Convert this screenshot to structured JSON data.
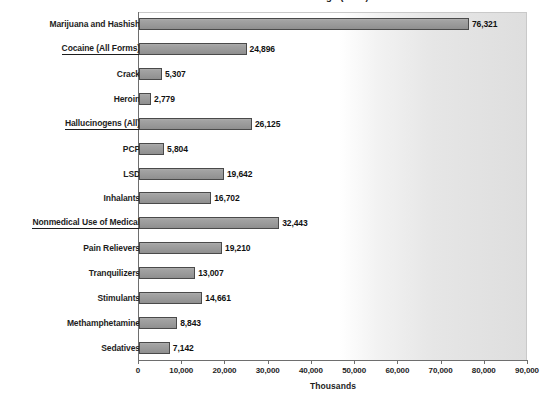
{
  "chart_data": {
    "type": "bar",
    "orientation": "horizontal",
    "title": "Past Year Use of Selected Drugs (2002)",
    "xlabel": "Thousands",
    "ylabel": "",
    "xlim": [
      0,
      90000
    ],
    "xticks": [
      0,
      10000,
      20000,
      30000,
      40000,
      50000,
      60000,
      70000,
      80000,
      90000
    ],
    "xticklabels": [
      "0",
      "10,000",
      "20,000",
      "30,000",
      "40,000",
      "50,000",
      "60,000",
      "70,000",
      "80,000",
      "90,000"
    ],
    "grid": false,
    "legend": null,
    "categories": [
      "Marijuana and Hashish",
      "Cocaine (All Forms)",
      "Crack",
      "Heroin",
      "Hallucinogens (All)",
      "PCP",
      "LSD",
      "Inhalants",
      "Nonmedical Use of Medical",
      "Pain Relievers",
      "Tranquilizers",
      "Stimulants",
      "Methamphetamine",
      "Sedatives"
    ],
    "values": [
      76321,
      24896,
      5307,
      2779,
      26125,
      5804,
      19642,
      16702,
      32443,
      19210,
      13007,
      14661,
      8843,
      7142
    ],
    "value_labels": [
      "76,321",
      "24,896",
      "5,307",
      "2,779",
      "26,125",
      "5,804",
      "19,642",
      "16,702",
      "32,443",
      "19,210",
      "13,007",
      "14,661",
      "8,843",
      "7,142"
    ],
    "underlined_categories": [
      "Cocaine (All Forms)",
      "Hallucinogens (All)",
      "Nonmedical Use of Medical"
    ],
    "bar_color": "#9a9a9a",
    "bar_border_color": "#4a4a4a",
    "plot_background_left": "#ffffff",
    "plot_background_right": "#dedede",
    "axis_color": "#6e6e6e",
    "text_color": "#1d1d1d"
  }
}
